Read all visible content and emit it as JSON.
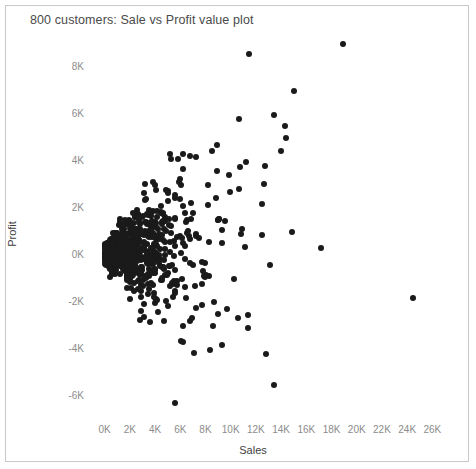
{
  "chart_data": {
    "type": "scatter",
    "title": "800 customers: Sale vs Profit value plot",
    "xlabel": "Sales",
    "ylabel": "Profit",
    "xlim": [
      -1000,
      27000
    ],
    "ylim": [
      -7000,
      9600
    ],
    "grid": false,
    "legend": null,
    "n_points": 800,
    "marker": {
      "shape": "circle",
      "color": "#1a1a1a",
      "size_px": 6
    },
    "xticks": [
      "0K",
      "2K",
      "4K",
      "6K",
      "8K",
      "10K",
      "12K",
      "14K",
      "16K",
      "18K",
      "20K",
      "22K",
      "24K",
      "26K"
    ],
    "xtick_values": [
      0,
      2000,
      4000,
      6000,
      8000,
      10000,
      12000,
      14000,
      16000,
      18000,
      20000,
      22000,
      24000,
      26000
    ],
    "yticks": [
      "8K",
      "6K",
      "4K",
      "2K",
      "0K",
      "-2K",
      "-4K",
      "-6K"
    ],
    "ytick_values": [
      8000,
      6000,
      4000,
      2000,
      0,
      -2000,
      -4000,
      -6000
    ],
    "outliers": [
      {
        "x": 18900,
        "y": 8900
      },
      {
        "x": 15000,
        "y": 6900
      },
      {
        "x": 13400,
        "y": 5900
      },
      {
        "x": 14300,
        "y": 5450
      },
      {
        "x": 14400,
        "y": 4900
      },
      {
        "x": 14000,
        "y": 4350
      },
      {
        "x": 11200,
        "y": 3900
      },
      {
        "x": 9900,
        "y": 3350
      },
      {
        "x": 24500,
        "y": -1900
      },
      {
        "x": 9300,
        "y": -3900
      },
      {
        "x": 5600,
        "y": -6350
      },
      {
        "x": 4200,
        "y": -2500
      },
      {
        "x": 3600,
        "y": -2900
      },
      {
        "x": 2900,
        "y": -2450
      },
      {
        "x": 3150,
        "y": -2700
      },
      {
        "x": 6900,
        "y": -2750
      },
      {
        "x": 14900,
        "y": 900
      },
      {
        "x": 12500,
        "y": 2100
      },
      {
        "x": 17200,
        "y": 250
      }
    ],
    "cluster": {
      "seed": 20240517,
      "count": 781,
      "model": "exponential sales, profit spread proportional to sales",
      "x_scale": 2600,
      "x_min": 0,
      "x_max": 13500,
      "spread_base": 210,
      "spread_slope": 0.26,
      "drift": 0.055
    }
  }
}
